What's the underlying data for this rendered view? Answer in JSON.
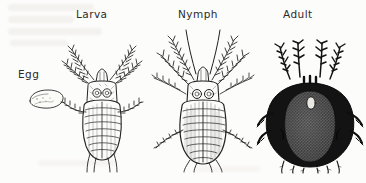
{
  "plate": {
    "title": "Mite life stages",
    "background_color": "#fcfcfa",
    "ink_color": "#1d1d1d",
    "width": 366,
    "height": 183,
    "medium": "scanned line engraving"
  },
  "labels": [
    {
      "text": "Egg",
      "x": 18,
      "y": 68,
      "for": "egg"
    },
    {
      "text": "Larva",
      "x": 76,
      "y": 8,
      "for": "larva"
    },
    {
      "text": "Nymph",
      "x": 178,
      "y": 8,
      "for": "nymph"
    },
    {
      "text": "Adult",
      "x": 283,
      "y": 8,
      "for": "adult"
    }
  ],
  "figures": [
    {
      "name": "egg",
      "caption": "Egg",
      "description": "small flattened oval, thin outline with light stipple",
      "x": 28,
      "y": 88,
      "width": 36,
      "height": 22,
      "shading": "outline"
    },
    {
      "name": "larva",
      "caption": "Larva",
      "description": "six-legged larval mite, pear-shaped segmented idiosoma with transverse striations, paired eye spots, feathered legs",
      "x": 58,
      "y": 38,
      "width": 86,
      "height": 132,
      "legs": 6,
      "shading": "fine line hatching"
    },
    {
      "name": "nymph",
      "caption": "Nymph",
      "description": "eight-legged nymph, larger body with dense hatching, long feathered palps and legs, paired eye spots on scutum",
      "x": 152,
      "y": 28,
      "width": 104,
      "height": 142,
      "legs": 8,
      "shading": "dense line hatching"
    },
    {
      "name": "adult",
      "caption": "Adult",
      "description": "engorged adult, heavily inked dark body with stippled mottled dorsal shield and pale ocellus, short stout legs",
      "x": 258,
      "y": 35,
      "width": 100,
      "height": 135,
      "legs": 8,
      "shading": "solid black with stipple"
    }
  ],
  "sequence": [
    "Egg",
    "Larva",
    "Nymph",
    "Adult"
  ]
}
